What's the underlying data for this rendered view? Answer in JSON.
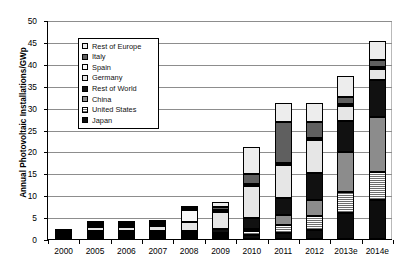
{
  "chart_data": {
    "type": "bar",
    "stacked": true,
    "title": "",
    "xlabel": "",
    "ylabel": "Annual Photovoltaic Installations/GWp",
    "ylim": [
      0,
      50
    ],
    "ytick_step": 5,
    "yticks": [
      0,
      5,
      10,
      15,
      20,
      25,
      30,
      35,
      40,
      45,
      50
    ],
    "grid": true,
    "legend_position": "upper-left-inside",
    "categories": [
      "2000",
      "2005",
      "2006",
      "2007",
      "2008",
      "2009",
      "2010",
      "2011",
      "2012",
      "2013e",
      "2014e"
    ],
    "series": [
      {
        "name": "Japan",
        "swatch": "solid-black",
        "color": "#0d0d0d",
        "values": [
          0.12,
          0.29,
          0.29,
          0.21,
          0.23,
          0.48,
          1.0,
          1.3,
          2.0,
          6.0,
          9.0
        ]
      },
      {
        "name": "United States",
        "swatch": "fine-hatch-gray",
        "color": "#6e6e6e",
        "values": [
          0.02,
          0.1,
          0.14,
          0.21,
          0.34,
          0.48,
          0.9,
          1.9,
          3.3,
          4.8,
          6.3
        ]
      },
      {
        "name": "China",
        "swatch": "medium-gray",
        "color": "#8c8c8c",
        "values": [
          0.0,
          0.01,
          0.01,
          0.02,
          0.04,
          0.16,
          0.5,
          2.2,
          3.5,
          9.0,
          12.5
        ]
      },
      {
        "name": "Rest of World",
        "swatch": "solid-black",
        "color": "#111111",
        "values": [
          0.05,
          0.12,
          0.2,
          0.3,
          0.55,
          0.9,
          2.4,
          4.0,
          6.2,
          7.2,
          8.5
        ]
      },
      {
        "name": "Germany",
        "swatch": "light-gray",
        "color": "#e6e6e6",
        "values": [
          0.04,
          0.95,
          0.85,
          1.1,
          1.95,
          3.8,
          7.4,
          7.5,
          7.6,
          3.3,
          2.5
        ]
      },
      {
        "name": "Spain",
        "swatch": "near-white",
        "color": "#fafafa",
        "values": [
          0.0,
          0.02,
          0.06,
          0.55,
          2.7,
          0.09,
          0.4,
          0.4,
          0.3,
          0.2,
          0.2
        ]
      },
      {
        "name": "Italy",
        "swatch": "dark-gray",
        "color": "#5f5f5f",
        "values": [
          0.0,
          0.01,
          0.01,
          0.05,
          0.3,
          0.72,
          2.3,
          9.3,
          3.6,
          1.6,
          1.6
        ]
      },
      {
        "name": "Rest of Europe",
        "swatch": "pale-gray",
        "color": "#ededed",
        "values": [
          0.02,
          0.05,
          0.09,
          0.16,
          0.44,
          1.1,
          6.1,
          4.4,
          4.5,
          4.9,
          4.4
        ]
      }
    ],
    "totals": [
      0.25,
      1.55,
      1.65,
      2.6,
      6.55,
      7.73,
      21.0,
      31.0,
      31.0,
      37.0,
      45.0
    ],
    "legend_entries": [
      {
        "label": "Rest of Europe",
        "swatch_class": "f-roe"
      },
      {
        "label": "Italy",
        "swatch_class": "f-italy"
      },
      {
        "label": "Spain",
        "swatch_class": "f-spain"
      },
      {
        "label": "Germany",
        "swatch_class": "f-germany"
      },
      {
        "label": "Rest of World",
        "swatch_class": "f-row"
      },
      {
        "label": "China",
        "swatch_class": "f-china"
      },
      {
        "label": "United States",
        "swatch_class": "f-us"
      },
      {
        "label": "Japan",
        "swatch_class": "f-japan"
      }
    ]
  }
}
